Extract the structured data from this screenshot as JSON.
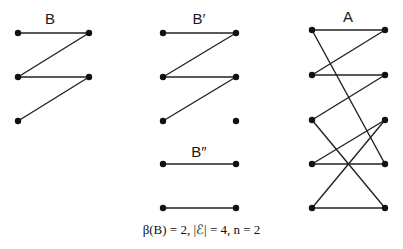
{
  "graphs": [
    {
      "id": "B",
      "label": "B",
      "label_pos": [
        50,
        24
      ],
      "nodes": [
        [
          18,
          33
        ],
        [
          89,
          33
        ],
        [
          18,
          77
        ],
        [
          89,
          77
        ],
        [
          18,
          121
        ]
      ],
      "edges": [
        [
          0,
          1
        ],
        [
          1,
          2
        ],
        [
          2,
          3
        ],
        [
          3,
          4
        ]
      ]
    },
    {
      "id": "B-prime",
      "label": "B′",
      "label_pos": [
        199,
        24
      ],
      "nodes": [
        [
          163,
          33
        ],
        [
          236,
          33
        ],
        [
          163,
          77
        ],
        [
          236,
          77
        ],
        [
          163,
          121
        ],
        [
          236,
          121
        ]
      ],
      "edges": [
        [
          0,
          1
        ],
        [
          1,
          2
        ],
        [
          2,
          3
        ],
        [
          3,
          4
        ]
      ]
    },
    {
      "id": "B-double-prime",
      "label": "B″",
      "label_pos": [
        199,
        157
      ],
      "nodes": [
        [
          163,
          164
        ],
        [
          236,
          164
        ],
        [
          163,
          208
        ],
        [
          236,
          208
        ]
      ],
      "edges": [
        [
          0,
          1
        ],
        [
          2,
          3
        ]
      ]
    },
    {
      "id": "A",
      "label": "A",
      "label_pos": [
        348,
        22
      ],
      "nodes": [
        [
          312,
          30
        ],
        [
          385,
          30
        ],
        [
          312,
          75
        ],
        [
          385,
          75
        ],
        [
          312,
          120
        ],
        [
          385,
          120
        ],
        [
          312,
          164
        ],
        [
          385,
          164
        ],
        [
          312,
          208
        ],
        [
          385,
          208
        ]
      ],
      "edges": [
        [
          0,
          1
        ],
        [
          0,
          7
        ],
        [
          1,
          2
        ],
        [
          2,
          3
        ],
        [
          3,
          4
        ],
        [
          4,
          9
        ],
        [
          5,
          6
        ],
        [
          5,
          8
        ],
        [
          6,
          7
        ],
        [
          8,
          9
        ]
      ]
    }
  ],
  "caption": "β(B) = 2, |ℰ| = 4, n = 2"
}
